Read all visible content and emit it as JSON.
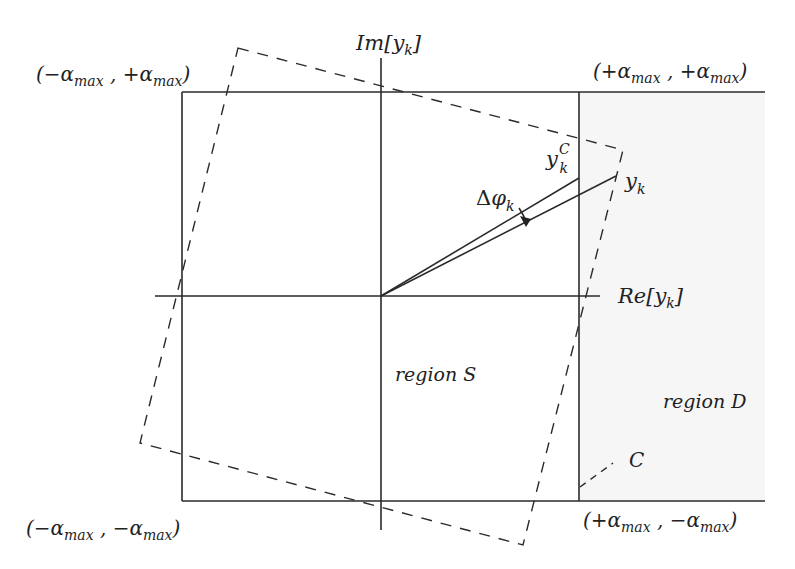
{
  "figure": {
    "type": "signal-constellation-clipping-diagram",
    "colors": {
      "line": "#2a2a2a",
      "text": "#222222",
      "region_d_fill": "#f6f6f6",
      "background": "#ffffff"
    }
  },
  "axes": {
    "imag_label": {
      "prefix": "Im[",
      "var": "y",
      "sub": "k",
      "suffix": "]"
    },
    "real_label": {
      "prefix": "Re[",
      "var": "y",
      "sub": "k",
      "suffix": "]"
    }
  },
  "corners": {
    "top_left": {
      "open": "(",
      "s1": "−",
      "a1": "α",
      "sub1": "max",
      "sep": " , ",
      "s2": "+",
      "a2": "α",
      "sub2": "max",
      "close": ")"
    },
    "top_right": {
      "open": "(",
      "s1": "+",
      "a1": "α",
      "sub1": "max",
      "sep": " , ",
      "s2": "+",
      "a2": "α",
      "sub2": "max",
      "close": ")"
    },
    "bottom_left": {
      "open": "(",
      "s1": "−",
      "a1": "α",
      "sub1": "max",
      "sep": " , ",
      "s2": "−",
      "a2": "α",
      "sub2": "max",
      "close": ")"
    },
    "bottom_right": {
      "open": "(",
      "s1": "+",
      "a1": "α",
      "sub1": "max",
      "sep": " , ",
      "s2": "−",
      "a2": "α",
      "sub2": "max",
      "close": ")"
    }
  },
  "vectors": {
    "clipped": {
      "var": "y",
      "sub": "k",
      "sup": "C"
    },
    "original": {
      "var": "y",
      "sub": "k"
    },
    "phase_shift": {
      "delta": "Δ",
      "var": "φ",
      "sub": "k"
    }
  },
  "regions": {
    "s": {
      "word": "region",
      "symbol": "S"
    },
    "d": {
      "word": "region",
      "symbol": "D"
    }
  },
  "boundary": {
    "label": "C"
  }
}
